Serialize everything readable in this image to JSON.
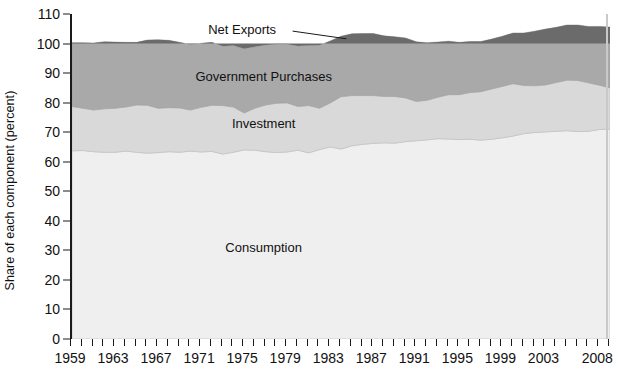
{
  "chart_data": {
    "type": "area",
    "stacked": true,
    "title": "",
    "subtitle": "",
    "xlabel": "",
    "ylabel": "Share of each component (percent)",
    "ylim": [
      0,
      110
    ],
    "ytick_values": [
      0,
      10,
      20,
      30,
      40,
      50,
      60,
      70,
      80,
      90,
      100,
      110
    ],
    "ytick_labels": [
      "0",
      "10",
      "20",
      "30",
      "40",
      "50",
      "60",
      "70",
      "80",
      "90",
      "100",
      "110"
    ],
    "xlim": [
      1959,
      2009
    ],
    "xtick_labels": [
      "1959",
      "1963",
      "1967",
      "1971",
      "1975",
      "1979",
      "1983",
      "1987",
      "1991",
      "1995",
      "1999",
      "2003",
      "2008"
    ],
    "xtick_values": [
      1959,
      1963,
      1967,
      1971,
      1975,
      1979,
      1983,
      1987,
      1991,
      1995,
      1999,
      2003,
      2008
    ],
    "xtick_minor_step": 1,
    "grid": false,
    "legend_position": "inline-annotations",
    "x": [
      1959,
      1960,
      1961,
      1962,
      1963,
      1964,
      1965,
      1966,
      1967,
      1968,
      1969,
      1970,
      1971,
      1972,
      1973,
      1974,
      1975,
      1976,
      1977,
      1978,
      1979,
      1980,
      1981,
      1982,
      1983,
      1984,
      1985,
      1986,
      1987,
      1988,
      1989,
      1990,
      1991,
      1992,
      1993,
      1994,
      1995,
      1996,
      1997,
      1998,
      1999,
      2000,
      2001,
      2002,
      2003,
      2004,
      2005,
      2006,
      2007,
      2008,
      2009
    ],
    "series": [
      {
        "name": "Consumption",
        "color": "#efefef",
        "label_position": {
          "x": 1977,
          "y": 31
        },
        "values": [
          63.7,
          63.8,
          63.4,
          63.2,
          63.2,
          63.6,
          63.2,
          62.9,
          63.1,
          63.4,
          63.2,
          63.6,
          63.3,
          63.5,
          62.6,
          63.2,
          64.0,
          63.9,
          63.4,
          63.1,
          63.3,
          63.9,
          63.0,
          64.1,
          65.0,
          64.3,
          65.4,
          65.9,
          66.2,
          66.4,
          66.3,
          66.8,
          67.1,
          67.4,
          67.8,
          67.7,
          67.5,
          67.6,
          67.3,
          67.6,
          68.1,
          68.7,
          69.5,
          69.9,
          70.1,
          70.3,
          70.5,
          70.2,
          70.3,
          70.9,
          71.0
        ]
      },
      {
        "name": "Investment",
        "color": "#d9d9d9",
        "label_position": {
          "x": 1977,
          "y": 73
        },
        "values": [
          15.0,
          14.3,
          14.1,
          14.7,
          14.9,
          14.9,
          16.0,
          16.2,
          15.0,
          14.9,
          15.0,
          13.9,
          15.1,
          15.6,
          16.4,
          15.3,
          12.5,
          14.2,
          15.8,
          16.7,
          16.6,
          14.8,
          16.0,
          14.0,
          14.9,
          17.7,
          17.0,
          16.5,
          16.2,
          15.7,
          15.8,
          14.8,
          13.3,
          13.4,
          14.0,
          15.0,
          15.2,
          15.8,
          16.4,
          17.0,
          17.4,
          17.7,
          16.3,
          15.8,
          15.9,
          16.5,
          17.1,
          17.3,
          16.4,
          15.0,
          14.0
        ]
      },
      {
        "name": "Government Purchases",
        "color": "#a9a9a9",
        "label_position": {
          "x": 1977,
          "y": 89
        },
        "values": [
          21.6,
          22.2,
          22.7,
          22.7,
          22.4,
          21.9,
          21.2,
          22.1,
          23.2,
          22.8,
          22.2,
          22.2,
          21.7,
          21.3,
          20.1,
          20.8,
          21.7,
          20.8,
          20.3,
          20.0,
          19.9,
          20.5,
          20.3,
          21.3,
          21.0,
          20.5,
          20.9,
          21.0,
          21.0,
          20.5,
          20.2,
          20.3,
          20.2,
          19.5,
          18.7,
          18.1,
          17.7,
          17.3,
          17.0,
          16.9,
          17.0,
          17.2,
          17.8,
          18.5,
          18.9,
          18.7,
          18.7,
          18.8,
          19.1,
          19.9,
          20.6
        ]
      },
      {
        "name": "Net Exports",
        "color": "#6b6b6b",
        "label_position": {
          "x": 1975,
          "y": 105
        },
        "leader_line": true,
        "values": [
          0.3,
          0.5,
          0.6,
          0.5,
          0.6,
          1.0,
          0.7,
          0.4,
          0.4,
          0.1,
          0.1,
          0.2,
          -0.1,
          -0.4,
          0.5,
          0.3,
          1.1,
          0.3,
          -0.6,
          -0.7,
          -0.3,
          -0.3,
          -0.2,
          -0.3,
          -0.9,
          -1.9,
          -2.4,
          -2.8,
          -2.8,
          -2.0,
          -1.2,
          -1.3,
          -0.5,
          -0.7,
          -1.2,
          -1.5,
          -1.3,
          -1.3,
          -1.2,
          -1.9,
          -2.7,
          -3.8,
          -3.6,
          -4.2,
          -4.6,
          -5.2,
          -5.7,
          -5.7,
          -5.0,
          -4.9,
          -3.6
        ]
      }
    ],
    "band_plot_tops": {
      "note": "Cumulative stacked tops used for rendering, percent units",
      "consumption_top": [
        63.7,
        63.8,
        63.4,
        63.2,
        63.2,
        63.6,
        63.2,
        62.9,
        63.1,
        63.4,
        63.2,
        63.6,
        63.3,
        63.5,
        62.6,
        63.2,
        64.0,
        63.9,
        63.4,
        63.1,
        63.3,
        63.9,
        63.0,
        64.1,
        65.0,
        64.3,
        65.4,
        65.9,
        66.2,
        66.4,
        66.3,
        66.8,
        67.1,
        67.4,
        67.8,
        67.7,
        67.5,
        67.6,
        67.3,
        67.6,
        68.1,
        68.7,
        69.5,
        69.9,
        70.1,
        70.3,
        70.5,
        70.2,
        70.3,
        70.9,
        71.0
      ],
      "investment_top": [
        78.7,
        78.1,
        77.5,
        77.9,
        78.1,
        78.5,
        79.2,
        79.1,
        78.1,
        78.3,
        78.2,
        77.5,
        78.4,
        79.1,
        79.0,
        78.5,
        76.5,
        78.1,
        79.2,
        79.8,
        79.9,
        78.7,
        79.0,
        78.1,
        79.9,
        82.0,
        82.4,
        82.4,
        82.4,
        82.1,
        82.1,
        81.6,
        80.4,
        80.8,
        81.8,
        82.7,
        82.7,
        83.4,
        83.7,
        84.6,
        85.5,
        86.4,
        85.8,
        85.7,
        86.0,
        86.8,
        87.6,
        87.5,
        86.7,
        85.9,
        85.0
      ],
      "government_top": [
        100.3,
        100.3,
        100.2,
        100.6,
        100.5,
        100.4,
        100.4,
        101.2,
        101.3,
        101.1,
        100.4,
        99.7,
        100.1,
        100.4,
        99.1,
        99.3,
        98.2,
        98.9,
        99.5,
        99.8,
        99.8,
        99.2,
        99.3,
        99.4,
        100.9,
        102.5,
        103.3,
        103.4,
        103.4,
        102.6,
        102.3,
        101.9,
        100.6,
        100.3,
        100.5,
        100.8,
        100.4,
        100.7,
        100.7,
        101.5,
        102.5,
        103.6,
        103.6,
        104.2,
        104.9,
        105.5,
        106.3,
        106.3,
        105.8,
        105.8,
        105.6
      ],
      "total_top": [
        100.0,
        100.0,
        100.0,
        100.0,
        100.0,
        100.0,
        100.0,
        100.0,
        100.0,
        100.0,
        100.0,
        100.0,
        100.0,
        100.0,
        100.0,
        100.0,
        100.0,
        100.0,
        100.0,
        100.0,
        100.0,
        100.0,
        100.0,
        100.0,
        100.0,
        100.0,
        100.0,
        100.0,
        100.0,
        100.0,
        100.0,
        100.0,
        100.0,
        100.0,
        100.0,
        100.0,
        100.0,
        100.0,
        100.0,
        100.0,
        100.0,
        100.0,
        100.0,
        100.0,
        100.0,
        100.0,
        100.0,
        100.0,
        100.0,
        100.0,
        100.0
      ]
    },
    "colors": {
      "consumption": "#efefef",
      "investment": "#d9d9d9",
      "government": "#a9a9a9",
      "net_exports": "#6b6b6b",
      "axis": "#1a1a1a",
      "text": "#111111",
      "background": "#ffffff"
    }
  }
}
